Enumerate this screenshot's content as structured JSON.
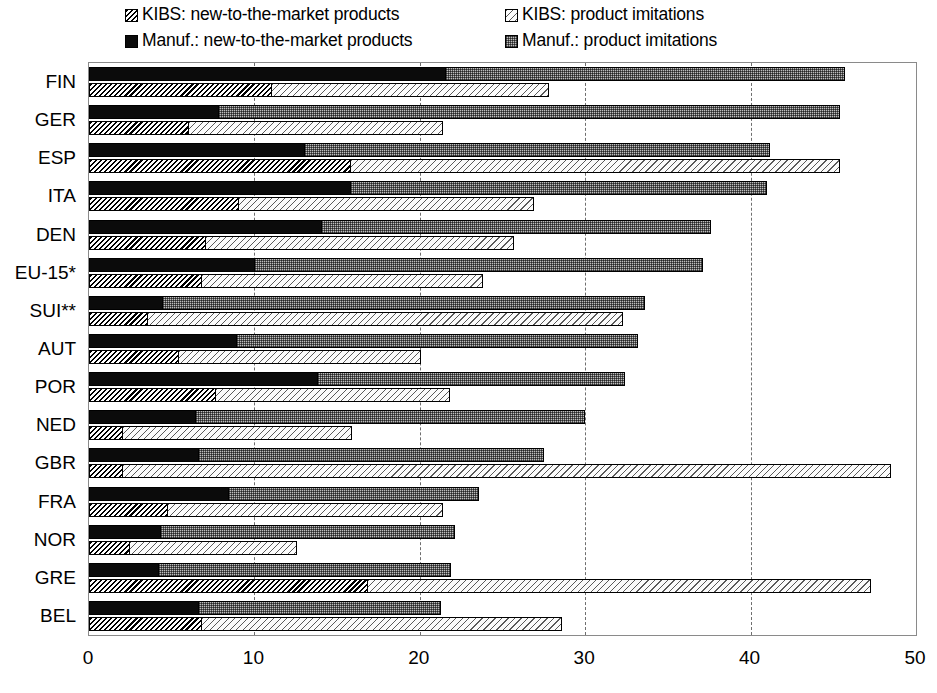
{
  "legend": {
    "items": [
      {
        "label": "KIBS: new-to-the-market products",
        "swatch": "kibs-new-swatch"
      },
      {
        "label": "KIBS: product imitations",
        "swatch": "kibs-imitations-swatch"
      },
      {
        "label": "Manuf.: new-to-the-market products",
        "swatch": "manuf-new-swatch"
      },
      {
        "label": "Manuf.: product imitations",
        "swatch": "manuf-imitations-swatch"
      }
    ]
  },
  "chart_data": {
    "type": "bar",
    "orientation": "horizontal",
    "stacked": true,
    "title": "",
    "xlabel": "",
    "ylabel": "",
    "xlim": [
      0,
      50
    ],
    "xticks": [
      0,
      10,
      20,
      30,
      40,
      50
    ],
    "grid": true,
    "grid_axis": "x",
    "legend_position": "top",
    "categories": [
      "FIN",
      "GER",
      "ESP",
      "ITA",
      "DEN",
      "EU-15*",
      "SUI**",
      "AUT",
      "POR",
      "NED",
      "GBR",
      "FRA",
      "NOR",
      "GRE",
      "BEL"
    ],
    "series": [
      {
        "name": "Manuf.: new-to-the-market products",
        "values": [
          21.5,
          7.8,
          13.0,
          15.8,
          14.0,
          10.0,
          4.4,
          8.9,
          13.8,
          6.4,
          6.6,
          8.4,
          4.3,
          4.2,
          6.6
        ]
      },
      {
        "name": "Manuf.: product imitations",
        "values": [
          24.2,
          37.6,
          28.2,
          25.2,
          23.6,
          27.1,
          29.2,
          24.3,
          18.6,
          23.6,
          20.9,
          15.2,
          17.8,
          17.7,
          14.7
        ]
      },
      {
        "name": "KIBS: new-to-the-market products",
        "values": [
          11.0,
          6.0,
          15.8,
          9.0,
          7.0,
          6.8,
          3.5,
          5.4,
          7.6,
          2.0,
          2.0,
          4.7,
          2.4,
          16.8,
          6.8
        ]
      },
      {
        "name": "KIBS: product imitations",
        "values": [
          16.8,
          15.4,
          29.6,
          17.9,
          18.7,
          17.0,
          28.8,
          14.7,
          14.2,
          13.9,
          46.5,
          16.7,
          10.2,
          30.5,
          21.8
        ]
      }
    ],
    "totals_manuf": [
      45.7,
      45.4,
      41.2,
      41.0,
      37.6,
      37.1,
      33.6,
      33.2,
      32.4,
      30.0,
      27.5,
      23.6,
      22.1,
      21.9,
      21.3
    ],
    "totals_kibs": [
      27.8,
      21.4,
      45.4,
      26.9,
      25.7,
      23.8,
      32.3,
      20.1,
      21.8,
      15.9,
      48.5,
      21.4,
      12.6,
      47.3,
      28.6
    ]
  }
}
